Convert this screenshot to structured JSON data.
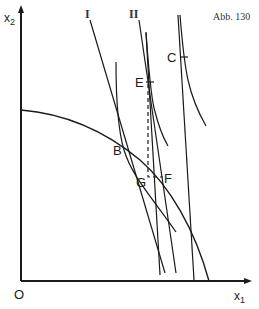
{
  "figure": {
    "caption": "Abb. 130",
    "axes": {
      "y_label": "x",
      "y_label_sub": "2",
      "x_label": "x",
      "x_label_sub": "1",
      "origin_label": "O"
    },
    "lines": {
      "line_1_label": "I",
      "line_2_label": "II"
    },
    "points": {
      "B": "B",
      "C": "C",
      "E": "E",
      "F": "F",
      "G": "G"
    },
    "colors": {
      "ink": "#1a1a1a",
      "background": "#ffffff"
    }
  }
}
